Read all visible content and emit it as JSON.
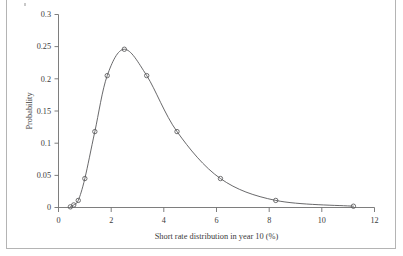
{
  "figure": {
    "frame_color": "#b4b4b4",
    "background": "#ffffff",
    "curve_color": "#58585a",
    "axis_color": "#6f6f6f"
  },
  "chart_data": {
    "type": "line",
    "title": "",
    "subtitle": "",
    "xlabel": "Short rate distribution in year 10 (%)",
    "ylabel": "Probability",
    "xlim": [
      0,
      12
    ],
    "ylim": [
      0,
      0.3
    ],
    "grid": false,
    "legend": false,
    "legend_position": "none",
    "markers": "open-circle",
    "xticks": [
      0,
      2,
      4,
      6,
      8,
      10,
      12
    ],
    "xtick_labels": [
      "0",
      "2",
      "4",
      "6",
      "8",
      "10",
      "12"
    ],
    "yticks": [
      0,
      0.05,
      0.1,
      0.15,
      0.2,
      0.25,
      0.3
    ],
    "ytick_labels": [
      "0",
      "0.05",
      "0.1",
      "0.15",
      "0.2",
      "0.25",
      "0.3"
    ],
    "series": [
      {
        "name": "Short rate probability distribution",
        "x": [
          0.45,
          0.58,
          0.75,
          1.0,
          1.38,
          1.85,
          2.5,
          3.35,
          4.5,
          6.15,
          8.25,
          11.2
        ],
        "values": [
          0.001,
          0.004,
          0.011,
          0.045,
          0.118,
          0.205,
          0.246,
          0.205,
          0.118,
          0.045,
          0.011,
          0.002
        ]
      }
    ]
  },
  "axis_titles": {
    "x": "Short rate distribution in year 10 (%)",
    "y": "Probability"
  }
}
